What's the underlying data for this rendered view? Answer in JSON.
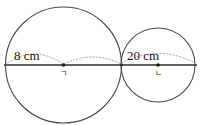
{
  "figure": {
    "type": "geometry-diagram",
    "background_color": "#ffffff",
    "stroke_color": "#4a4a4a",
    "line_color": "#3a3a3a",
    "dotted_color": "#9a9a9a",
    "text_color": "#1a1a1a"
  },
  "shapes": {
    "left_circle": {
      "name": "left-circle",
      "center_x": 63.5,
      "center_y": 65,
      "radius": 58,
      "center_label": "ㄱ",
      "measure_label": "8 cm"
    },
    "right_circle": {
      "name": "right-circle",
      "center_x": 158,
      "center_y": 65,
      "radius": 37,
      "center_label": "ㄴ",
      "measure_label": "20 cm"
    }
  },
  "baseline": {
    "name": "horizontal-axis",
    "x_start": 4,
    "x_end": 197,
    "y": 65
  },
  "labels": {
    "left_radius": "8 cm",
    "right_radius": "20 cm",
    "left_center": "ㄱ",
    "right_center": "ㄴ"
  }
}
